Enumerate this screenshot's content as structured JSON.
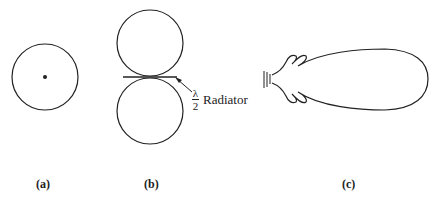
{
  "figure": {
    "panels": [
      {
        "id": "a",
        "label": "(a)",
        "description": "circle with center dot"
      },
      {
        "id": "b",
        "label": "(b)",
        "description": "figure-eight pattern of two tangent circles"
      },
      {
        "id": "c",
        "label": "(c)",
        "description": "directional lobe with side lobes"
      }
    ],
    "annotation": {
      "fraction_numerator": "λ",
      "fraction_denominator": "2",
      "text": "Radiator"
    },
    "stroke_color": "#222222",
    "background": "#ffffff"
  }
}
